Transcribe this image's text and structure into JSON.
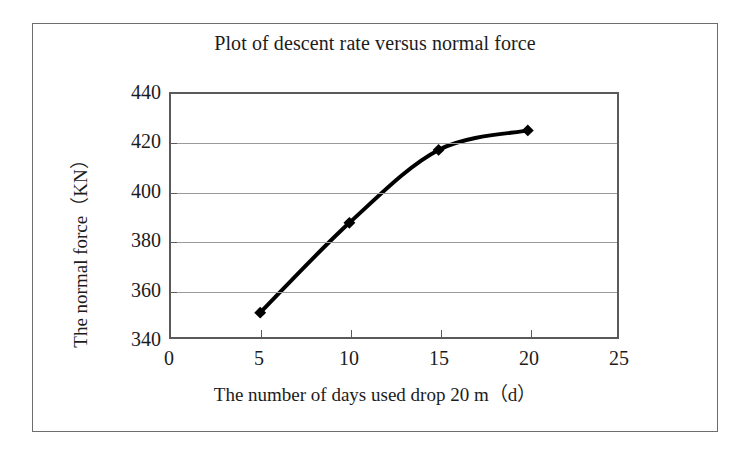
{
  "figure": {
    "title": "Plot of descent rate versus normal force",
    "frame_border_color": "#6d6d6d",
    "background": "#ffffff"
  },
  "chart_data": {
    "type": "line",
    "title": "Plot of descent rate versus normal force",
    "xlabel": "The number of days used drop 20 m（d）",
    "ylabel": "The normal force（KN）",
    "xlim": [
      0,
      25
    ],
    "ylim": [
      340,
      440
    ],
    "xticks": [
      0,
      5,
      10,
      15,
      20,
      25
    ],
    "xtick_labels": [
      "0",
      "5",
      "10",
      "15",
      "20",
      "25"
    ],
    "yticks": [
      340,
      360,
      380,
      400,
      420,
      440
    ],
    "ytick_labels": [
      "340",
      "360",
      "380",
      "400",
      "420",
      "440"
    ],
    "grid": "horizontal",
    "legend": "none",
    "series": [
      {
        "name": "normal force",
        "marker": "diamond",
        "marker_color": "#000000",
        "line_color": "#000000",
        "line_width": 4,
        "x": [
          5,
          10,
          15,
          20
        ],
        "y": [
          350,
          387,
          417,
          425
        ],
        "points": [
          {
            "x": 5,
            "y": 350
          },
          {
            "x": 10,
            "y": 387
          },
          {
            "x": 15,
            "y": 417
          },
          {
            "x": 20,
            "y": 425
          }
        ]
      }
    ]
  },
  "axes": {
    "y_title": "The normal force（KN）",
    "x_title": "The number of days used drop 20 m（d）"
  },
  "colors": {
    "grid": "#9a9a9a",
    "axis": "#5a5a5a",
    "text": "#1c1c1c",
    "series": "#000000"
  }
}
